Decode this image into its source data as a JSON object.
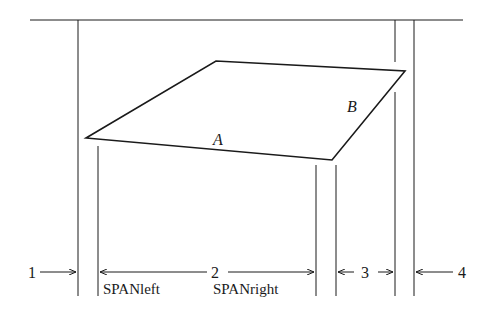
{
  "diagram": {
    "stroke_color": "#1a1a1a",
    "background": "#ffffff",
    "polygon": {
      "vertices": [
        [
          86,
          138
        ],
        [
          216,
          61
        ],
        [
          405,
          71
        ],
        [
          332,
          160
        ]
      ],
      "edge_labels": [
        {
          "text": "A",
          "x": 213,
          "y": 145
        },
        {
          "text": "B",
          "x": 347,
          "y": 112
        }
      ]
    },
    "top_line": {
      "x1": 30,
      "x2": 463,
      "y": 20
    },
    "region_labels": [
      {
        "text": "1",
        "x": 31,
        "y": 278
      },
      {
        "text": "2",
        "x": 216,
        "y": 278
      },
      {
        "text": "3",
        "x": 366,
        "y": 278
      },
      {
        "text": "4",
        "x": 463,
        "y": 278
      }
    ],
    "span_labels": [
      {
        "text": "SPANleft",
        "x": 103,
        "y": 292
      },
      {
        "text": "SPANright",
        "x": 212,
        "y": 292
      }
    ]
  }
}
